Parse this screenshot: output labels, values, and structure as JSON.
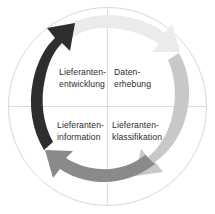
{
  "diagram": {
    "type": "cycle",
    "title": "",
    "shape": "circle",
    "direction": "clockwise",
    "segments": [
      {
        "id": "lieferantenentwicklung",
        "position": "top-left",
        "label": "Lieferanten-\nentwicklung",
        "arrow_name": "arrow-left-upward",
        "arrow_color": "#2e2e2e",
        "arrow_tone": "dark"
      },
      {
        "id": "datenerhebung",
        "position": "top-right",
        "label": "Daten-\nerhebung",
        "arrow_name": "arrow-top-rightward",
        "arrow_color": "#ebebeb",
        "arrow_tone": "very-light"
      },
      {
        "id": "lieferanteninformation",
        "position": "bottom-left",
        "label": "Lieferanten-\ninformation",
        "arrow_name": "arrow-bottom-leftward",
        "arrow_color": "#8a8a8a",
        "arrow_tone": "medium"
      },
      {
        "id": "lieferantenklassifikation",
        "position": "bottom-right",
        "label": "Lieferanten-\nklassifikation",
        "arrow_name": "arrow-right-downward",
        "arrow_color": "#c8c8c8",
        "arrow_tone": "light"
      }
    ],
    "colors": {
      "background": "#ffffff",
      "circle_outline": "#d8d8d8",
      "divider_line": "#dcdcdc",
      "text": "#2b2b2b",
      "arrow_dark": "#2e2e2e",
      "arrow_very_light": "#ebebeb",
      "arrow_medium": "#8a8a8a",
      "arrow_light": "#c8c8c8"
    },
    "geometry": {
      "center_x": 107.5,
      "center_y": 106.5,
      "radius": 99
    }
  }
}
